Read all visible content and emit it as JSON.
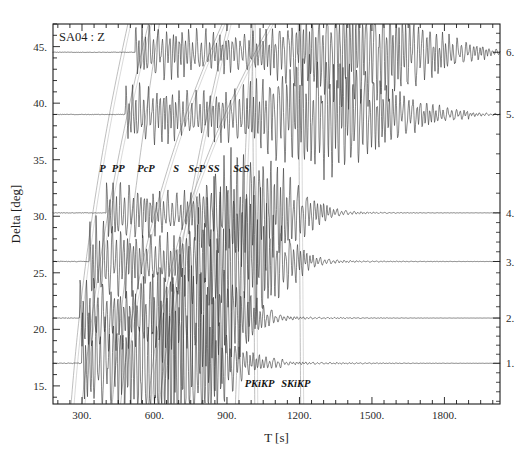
{
  "figure": {
    "title": "SA04 : Z",
    "xlabel": "T [s]",
    "ylabel": "Delta [deg]"
  },
  "chart_data": {
    "type": "line",
    "title": "SA04 : Z",
    "subtitle": "Seismic record section — vertical component",
    "xlabel": "T [s]",
    "ylabel": "Delta [deg]",
    "xlim": [
      180,
      2030
    ],
    "ylim": [
      13.4,
      47.0
    ],
    "grid": false,
    "legend_position": "none",
    "x_ticks_major": [
      300,
      600,
      900,
      1200,
      1500,
      1800
    ],
    "x_tick_labels": [
      "300.",
      "600.",
      "900.",
      "1200.",
      "1500.",
      "1800."
    ],
    "x_tick_minor_step": 50,
    "y_ticks_major": [
      15,
      20,
      25,
      30,
      35,
      40,
      45
    ],
    "y_tick_labels": [
      "15.",
      "20.",
      "25.",
      "30.",
      "35.",
      "40.",
      "45."
    ],
    "y_tick_minor_step": 1,
    "right_axis": {
      "label_type": "trace-number",
      "ticks": [
        1,
        2,
        3,
        4,
        5,
        6
      ],
      "tick_labels": [
        "1.",
        "2.",
        "3.",
        "4.",
        "5.",
        "6."
      ],
      "minor_step": 0.2
    },
    "traces": [
      {
        "number": 1,
        "label": "1.",
        "delta": 17.0,
        "onset_t": 300,
        "coda_end_t": 1130,
        "amp": 5.6,
        "main_t": 700,
        "color": "#3b3b3b"
      },
      {
        "number": 2,
        "label": "2.",
        "delta": 21.0,
        "onset_t": 290,
        "coda_end_t": 1100,
        "amp": 4.6,
        "main_t": 790,
        "color": "#3b3b3b"
      },
      {
        "number": 3,
        "label": "3.",
        "delta": 26.0,
        "onset_t": 330,
        "coda_end_t": 1220,
        "amp": 4.8,
        "main_t": 940,
        "color": "#3b3b3b"
      },
      {
        "number": 4,
        "label": "4.",
        "delta": 30.3,
        "onset_t": 400,
        "coda_end_t": 1320,
        "amp": 3.6,
        "main_t": 1010,
        "color": "#3b3b3b"
      },
      {
        "number": 5,
        "label": "5.",
        "delta": 39.0,
        "onset_t": 480,
        "coda_end_t": 1900,
        "amp": 3.4,
        "main_t": 1310,
        "color": "#3b3b3b"
      },
      {
        "number": 6,
        "label": "6.",
        "delta": 44.5,
        "onset_t": 520,
        "coda_end_t": 1980,
        "amp": 3.2,
        "main_t": 1450,
        "color": "#3b3b3b"
      }
    ],
    "phase_curves": [
      {
        "name": "P",
        "label": "P",
        "label_t": 385,
        "t_at_delta_min": 255,
        "t_at_delta_max": 490,
        "curvature": -0.22,
        "color": "#9a9a9a"
      },
      {
        "name": "PP",
        "label": "PP",
        "label_t": 450,
        "t_at_delta_min": 300,
        "t_at_delta_max": 575,
        "curvature": -0.2,
        "color": "#9a9a9a"
      },
      {
        "name": "PcP",
        "label": "PcP",
        "label_t": 565,
        "t_at_delta_min": 425,
        "t_at_delta_max": 620,
        "curvature": -0.12,
        "color": "#9a9a9a"
      },
      {
        "name": "S",
        "label": "S",
        "label_t": 690,
        "t_at_delta_min": 460,
        "t_at_delta_max": 880,
        "curvature": -0.3,
        "color": "#9a9a9a"
      },
      {
        "name": "ScP",
        "label": "ScP",
        "label_t": 775,
        "t_at_delta_min": 620,
        "t_at_delta_max": 905,
        "curvature": -0.16,
        "color": "#9a9a9a"
      },
      {
        "name": "SS",
        "label": "SS",
        "label_t": 845,
        "t_at_delta_min": 575,
        "t_at_delta_max": 1080,
        "curvature": -0.34,
        "color": "#9a9a9a"
      },
      {
        "name": "ScS",
        "label": "ScS",
        "label_t": 960,
        "t_at_delta_min": 935,
        "t_at_delta_max": 1000,
        "curvature": -0.05,
        "color": "#9a9a9a"
      },
      {
        "name": "PKiKP",
        "label": "PKiKP",
        "label_t": 1035,
        "t_at_delta_min": 1015,
        "t_at_delta_max": 1005,
        "curvature": 0.02,
        "color": "#9a9a9a"
      },
      {
        "name": "SKiKP",
        "label": "SKiKP",
        "label_t": 1185,
        "t_at_delta_min": 1205,
        "t_at_delta_max": 1195,
        "curvature": 0.02,
        "color": "#9a9a9a"
      }
    ],
    "phase_labels_upper": [
      "P",
      "PP",
      "PcP",
      "S",
      "ScP",
      "SS",
      "ScS"
    ],
    "phase_labels_lower": [
      "PKiKP",
      "SKiKP"
    ],
    "colors": {
      "frame": "#1c1c1c",
      "trace": "#3b3b3b",
      "phase_curve": "#9a9a9a",
      "background": "#ffffff",
      "text": "#1c1c1c"
    }
  }
}
